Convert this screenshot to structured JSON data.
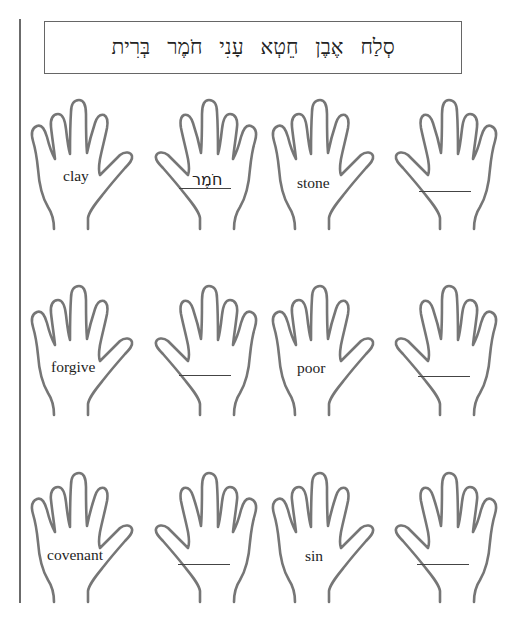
{
  "worksheet": {
    "word_bank": [
      "בְּרִית",
      "חֹמֶר",
      "עָנִי",
      "חֵטְא",
      "אֶבֶן",
      "סְלַח"
    ],
    "rows": [
      {
        "pairs": [
          {
            "english": "clay",
            "hebrew_answer": "חֹמֶר"
          },
          {
            "english": "stone",
            "hebrew_answer": ""
          }
        ]
      },
      {
        "pairs": [
          {
            "english": "forgive",
            "hebrew_answer": ""
          },
          {
            "english": "poor",
            "hebrew_answer": ""
          }
        ]
      },
      {
        "pairs": [
          {
            "english": "covenant",
            "hebrew_answer": ""
          },
          {
            "english": "sin",
            "hebrew_answer": ""
          }
        ]
      }
    ]
  }
}
